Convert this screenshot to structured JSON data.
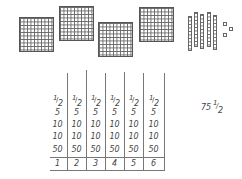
{
  "blocks": {
    "flats_count": 4,
    "rods_count": 5,
    "units_count": 3
  },
  "table": {
    "columns": [
      {
        "fraction": {
          "numerator": "1",
          "denominator": "2"
        },
        "values": [
          "5",
          "10",
          "10",
          "50"
        ],
        "index": "1"
      },
      {
        "fraction": {
          "numerator": "1",
          "denominator": "2"
        },
        "values": [
          "5",
          "10",
          "10",
          "50"
        ],
        "index": "2"
      },
      {
        "fraction": {
          "numerator": "1",
          "denominator": "2"
        },
        "values": [
          "5",
          "10",
          "10",
          "50"
        ],
        "index": "3"
      },
      {
        "fraction": {
          "numerator": "1",
          "denominator": "2"
        },
        "values": [
          "5",
          "10",
          "10",
          "50"
        ],
        "index": "4"
      },
      {
        "fraction": {
          "numerator": "1",
          "denominator": "2"
        },
        "values": [
          "5",
          "10",
          "10",
          "50"
        ],
        "index": "5"
      },
      {
        "fraction": {
          "numerator": "1",
          "denominator": "2"
        },
        "values": [
          "5",
          "10",
          "10",
          "50"
        ],
        "index": "6"
      }
    ]
  },
  "total": {
    "whole": "75",
    "numerator": "1",
    "denominator": "2"
  }
}
